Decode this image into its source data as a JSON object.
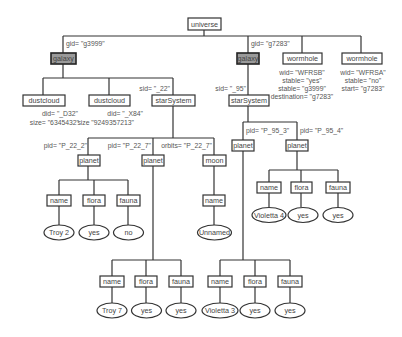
{
  "diagram": {
    "type": "xml-tree",
    "nodes": {
      "universe": "universe",
      "galaxy1": "galaxy",
      "galaxy2": "galaxy",
      "dustcloud1": "dustcloud",
      "dustcloud2": "dustcloud",
      "starSystem1": "starSystem",
      "starSystem2": "starSystem",
      "wormhole1": "wormhole",
      "wormhole2": "wormhole",
      "planet_22_2": "planet",
      "planet_22_7": "planet",
      "moon": "moon",
      "planet_95_3": "planet",
      "planet_95_4": "planet",
      "p222_name": "name",
      "p222_flora": "flora",
      "p222_fauna": "fauna",
      "p222_name_val": "Troy 2",
      "p222_flora_val": "yes",
      "p222_fauna_val": "no",
      "moon_name": "name",
      "moon_name_val": "Unnamed",
      "p954_name": "name",
      "p954_flora": "flora",
      "p954_fauna": "fauna",
      "p954_name_val": "Violetta 4",
      "p954_flora_val": "yes",
      "p954_fauna_val": "yes",
      "p227_name": "name",
      "p227_flora": "flora",
      "p227_fauna": "fauna",
      "p227_name_val": "Troy 7",
      "p227_flora_val": "yes",
      "p227_fauna_val": "yes",
      "p953_name": "name",
      "p953_flora": "flora",
      "p953_fauna": "fauna",
      "p953_name_val": "Violetta 3",
      "p953_flora_val": "yes",
      "p953_fauna_val": "yes"
    },
    "attributes": {
      "galaxy1_gid": "gid= \"g3999\"",
      "galaxy2_gid": "gid= \"g7283\"",
      "dustcloud1_did": "did= \"_D32\"",
      "dustcloud1_size": "size= \"6345432\"",
      "dustcloud2_did": "did= \"_X84\"",
      "dustcloud2_size": "size \"9249357213\"",
      "starSystem1_sid": "sid= \"_22\"",
      "starSystem2_sid": "sid= \"_95\"",
      "wormhole1_wid": "wid= \"WFRSB\"",
      "wormhole1_stable": "stable= \"yes\"",
      "wormhole1_stable2": "stable= \"g3999\"",
      "wormhole1_destination": "destination= \"g7283\"",
      "wormhole2_wid": "wid= \"WFRSA\"",
      "wormhole2_stable": "stable= \"no\"",
      "wormhole2_start": "start= \"g7283\"",
      "planet_22_2_pid": "pid= \"P_22_2\"",
      "planet_22_7_pid": "pid= \"P_22_7\"",
      "moon_orbits": "orbits= \"P_22_7\"",
      "planet_95_3_pid": "pid= \"P_95_3\"",
      "planet_95_4_pid": "pid= \"P_95_4\""
    }
  }
}
